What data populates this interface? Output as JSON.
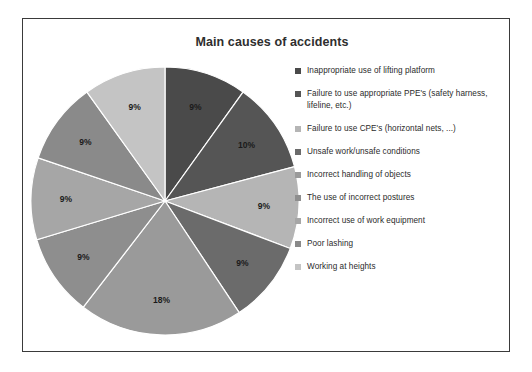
{
  "chart_data": {
    "type": "pie",
    "title": "Main causes of accidents",
    "categories": [
      "Inappropriate use of lifting platform",
      "Failure to use appropriate PPE's (safety harness, lifeline, etc.)",
      "Failure to use CPE's (horizontal nets, ...)",
      "Unsafe work/unsafe conditions",
      "Incorrect handling of objects",
      "The use of incorrect postures",
      "Incorrect use of work equipment",
      "Poor lashing",
      "Working at heights"
    ],
    "values": [
      9,
      10,
      9,
      9,
      18,
      9,
      9,
      9,
      9
    ],
    "value_labels": [
      "9%",
      "10%",
      "9%",
      "9%",
      "18%",
      "9%",
      "9%",
      "9%",
      "9%"
    ],
    "colors": [
      "#4a4a4a",
      "#555555",
      "#b5b5b5",
      "#6b6b6b",
      "#9a9a9a",
      "#8e8e8e",
      "#a6a6a6",
      "#8a8a8a",
      "#c4c4c4"
    ],
    "xlabel": "",
    "ylabel": "",
    "grid": false,
    "legend_position": "right",
    "start_angle": 0,
    "direction": "clockwise"
  },
  "legend": {
    "items": [
      {
        "label": "Inappropriate use of lifting platform",
        "color": "#4a4a4a"
      },
      {
        "label": "Failure to use appropriate PPE's (safety harness, lifeline, etc.)",
        "color": "#555555"
      },
      {
        "label": "Failure to use CPE's (horizontal nets, ...)",
        "color": "#b5b5b5"
      },
      {
        "label": "Unsafe work/unsafe conditions",
        "color": "#6b6b6b"
      },
      {
        "label": "Incorrect handling of objects",
        "color": "#9a9a9a"
      },
      {
        "label": "The use of incorrect postures",
        "color": "#8e8e8e"
      },
      {
        "label": "Incorrect use of work equipment",
        "color": "#a6a6a6"
      },
      {
        "label": "Poor lashing",
        "color": "#8a8a8a"
      },
      {
        "label": "Working at heights",
        "color": "#c4c4c4"
      }
    ]
  }
}
